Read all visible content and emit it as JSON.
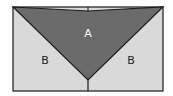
{
  "diagram": {
    "colors": {
      "background": "#ffffff",
      "region_a": "#6b6b6b",
      "region_b": "#d9d9d9",
      "stroke": "#1a1a1a",
      "label_a": "#ffffff",
      "label_b": "#222222"
    },
    "regions": [
      {
        "id": "A",
        "label": "A"
      },
      {
        "id": "B-left",
        "label": "B"
      },
      {
        "id": "B-right",
        "label": "B"
      }
    ]
  }
}
